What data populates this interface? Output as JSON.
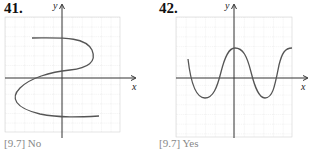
{
  "problems": [
    {
      "number": "41.",
      "answer": "[9.7] No",
      "x_label": "x",
      "y_label": "y",
      "curve": "S-shaped curve (fails vertical line test)"
    },
    {
      "number": "42.",
      "answer": "[9.7] Yes",
      "x_label": "x",
      "y_label": "y",
      "curve": "wave curve (passes vertical line test)"
    }
  ],
  "colors": {
    "grid": "#d0d0d0",
    "axis": "#333333",
    "curve": "#555555",
    "answer_text": "#888888"
  }
}
